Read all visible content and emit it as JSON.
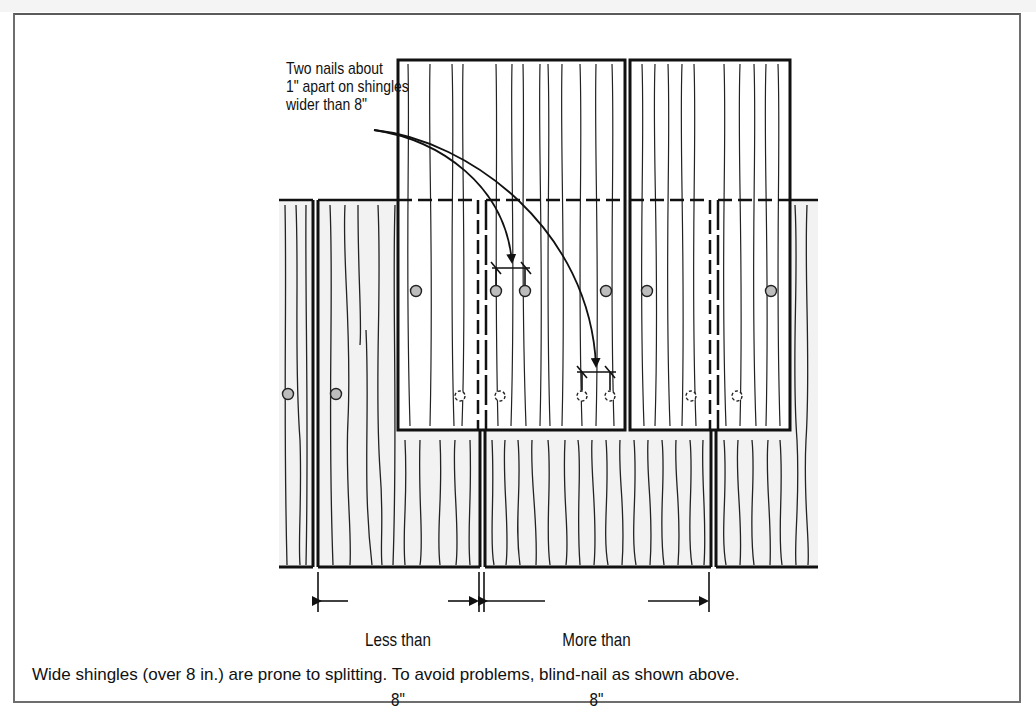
{
  "figure": {
    "callout_text": "Two nails about\n1\" apart on shingles\nwider than 8\"",
    "dimension_left": {
      "line1": "Less than",
      "line2": "8\""
    },
    "dimension_right": {
      "line1": "More than",
      "line2": "8\""
    },
    "caption": "Wide shingles (over 8 in.) are prone to splitting. To avoid problems, blind-nail as shown above."
  },
  "colors": {
    "frame_border": "#6e6e6e",
    "ink": "#111111",
    "lower_shingle_fill": "#f2f2f2",
    "upper_shingle_fill": "#ffffff",
    "nail_fill": "#bdbdbd"
  },
  "legend": {
    "nail_visible": "solid gray circle = exposed nail",
    "nail_hidden": "dashed circle = concealed nail"
  }
}
